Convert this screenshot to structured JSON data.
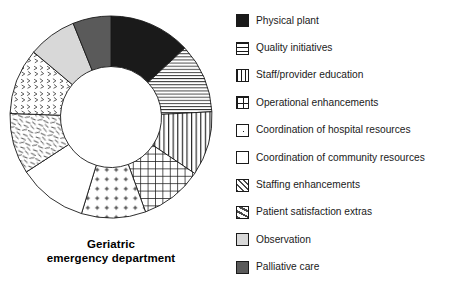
{
  "chart_data": {
    "type": "pie",
    "variant": "donut",
    "title": "Geriatric emergency department",
    "title_lines": [
      "Geriatric",
      "emergency department"
    ],
    "xlabel": "",
    "ylabel": "",
    "legend_position": "right",
    "grid": false,
    "start_angle_deg": 0,
    "direction": "clockwise",
    "inner_radius_ratio": 0.5,
    "categories": [
      "Physical plant",
      "Quality initiatives",
      "Staff/provider education",
      "Operational enhancements",
      "Coordination of hospital resources",
      "Coordination of community resources",
      "Staffing enhancements",
      "Patient satisfaction extras",
      "Observation",
      "Palliative care"
    ],
    "values": [
      13.1,
      11.1,
      10.3,
      10.0,
      10.3,
      11.1,
      9.7,
      10.6,
      7.8,
      6.0
    ],
    "slices": [
      {
        "label": "Physical plant",
        "value": 13.1,
        "start_deg": 0,
        "end_deg": 47,
        "fill": "solid-black",
        "color": "#1a1a1a"
      },
      {
        "label": "Quality initiatives",
        "value": 11.1,
        "start_deg": 47,
        "end_deg": 87,
        "fill": "horizontal-lines",
        "color": "#ffffff"
      },
      {
        "label": "Staff/provider education",
        "value": 10.3,
        "start_deg": 87,
        "end_deg": 124,
        "fill": "vertical-lines",
        "color": "#ffffff"
      },
      {
        "label": "Operational enhancements",
        "value": 10.0,
        "start_deg": 124,
        "end_deg": 160,
        "fill": "grid",
        "color": "#ffffff"
      },
      {
        "label": "Coordination of hospital resources",
        "value": 10.3,
        "start_deg": 160,
        "end_deg": 197,
        "fill": "dots",
        "color": "#ffffff"
      },
      {
        "label": "Coordination of community resources",
        "value": 11.1,
        "start_deg": 197,
        "end_deg": 237,
        "fill": "blank",
        "color": "#ffffff"
      },
      {
        "label": "Staffing enhancements",
        "value": 9.7,
        "start_deg": 237,
        "end_deg": 272,
        "fill": "dashes",
        "color": "#ffffff"
      },
      {
        "label": "Patient satisfaction extras",
        "value": 10.6,
        "start_deg": 272,
        "end_deg": 310,
        "fill": "chevrons",
        "color": "#ffffff"
      },
      {
        "label": "Observation",
        "value": 7.8,
        "start_deg": 310,
        "end_deg": 338,
        "fill": "light-gray",
        "color": "#d8d8d8"
      },
      {
        "label": "Palliative care",
        "value": 6.0,
        "start_deg": 338,
        "end_deg": 360,
        "fill": "dark-gray",
        "color": "#5a5a5a"
      }
    ]
  },
  "chart": {
    "title_line1": "Geriatric",
    "title_line2": "emergency department"
  },
  "legend": {
    "items": [
      {
        "label": "Physical plant",
        "swatch": "swatch-solid-black-icon",
        "fill": "solid-black"
      },
      {
        "label": "Quality initiatives",
        "swatch": "swatch-horizontal-lines-icon",
        "fill": "horizontal-lines"
      },
      {
        "label": "Staff/provider education",
        "swatch": "swatch-vertical-lines-icon",
        "fill": "vertical-lines"
      },
      {
        "label": "Operational enhancements",
        "swatch": "swatch-grid-icon",
        "fill": "grid"
      },
      {
        "label": "Coordination of hospital resources",
        "swatch": "swatch-dots-icon",
        "fill": "dots"
      },
      {
        "label": "Coordination of community resources",
        "swatch": "swatch-blank-icon",
        "fill": "blank"
      },
      {
        "label": "Staffing enhancements",
        "swatch": "swatch-chevrons-icon",
        "fill": "chevrons"
      },
      {
        "label": "Patient satisfaction extras",
        "swatch": "swatch-dashes-icon",
        "fill": "dashes"
      },
      {
        "label": "Observation",
        "swatch": "swatch-light-gray-icon",
        "fill": "light-gray"
      },
      {
        "label": "Palliative care",
        "swatch": "swatch-dark-gray-icon",
        "fill": "dark-gray"
      }
    ]
  },
  "colors": {
    "stroke": "#1a1a1a",
    "black": "#1a1a1a",
    "dark_gray": "#5a5a5a",
    "light_gray": "#d8d8d8",
    "white": "#ffffff"
  }
}
